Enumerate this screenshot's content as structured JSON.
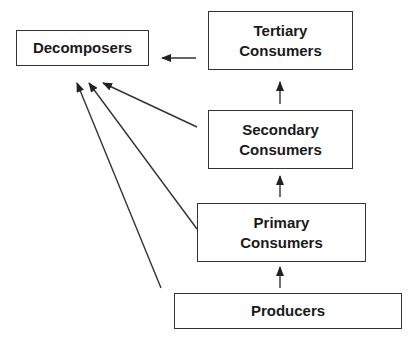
{
  "diagram": {
    "type": "food-web-energy-flow",
    "nodes": [
      {
        "id": "decomposers",
        "label": "Decomposers"
      },
      {
        "id": "tertiary",
        "line1": "Tertiary",
        "line2": "Consumers"
      },
      {
        "id": "secondary",
        "line1": "Secondary",
        "line2": "Consumers"
      },
      {
        "id": "primary",
        "line1": "Primary",
        "line2": "Consumers"
      },
      {
        "id": "producers",
        "label": "Producers"
      }
    ],
    "edges": [
      {
        "from": "producers",
        "to": "primary"
      },
      {
        "from": "primary",
        "to": "secondary"
      },
      {
        "from": "secondary",
        "to": "tertiary"
      },
      {
        "from": "tertiary",
        "to": "decomposers"
      },
      {
        "from": "secondary",
        "to": "decomposers"
      },
      {
        "from": "primary",
        "to": "decomposers"
      },
      {
        "from": "producers",
        "to": "decomposers"
      }
    ],
    "colors": {
      "line": "#333333",
      "box_border": "#333333",
      "text": "#1a1a1a",
      "background": "#ffffff"
    }
  }
}
